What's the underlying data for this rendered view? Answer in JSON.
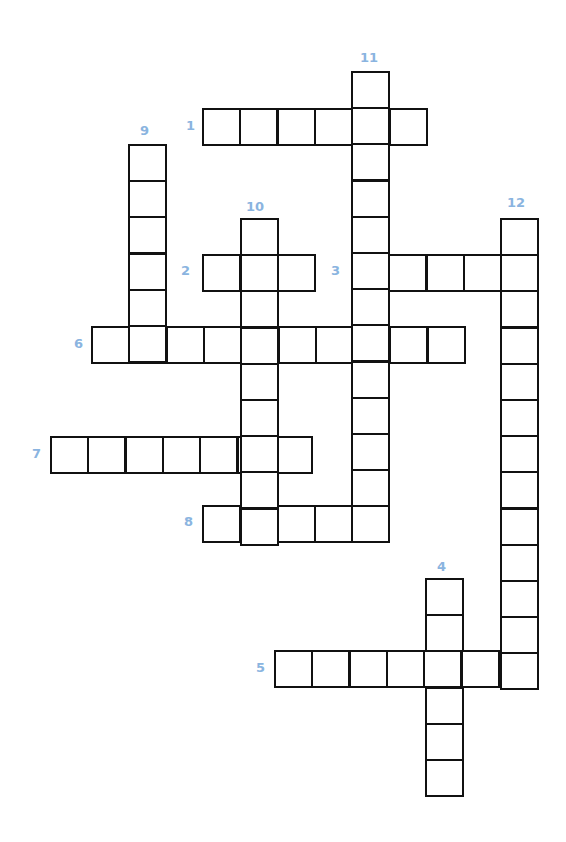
{
  "puzzle": {
    "type": "crossword",
    "label_color": "#8ab4e0",
    "line_color": "#111111",
    "entries": [
      {
        "number": "1",
        "direction": "across",
        "length": 6,
        "x": 202,
        "y": 108,
        "label_x": 186,
        "label_y": 119
      },
      {
        "number": "2",
        "direction": "across",
        "length": 3,
        "x": 202,
        "y": 254,
        "label_x": 181,
        "label_y": 264
      },
      {
        "number": "3",
        "direction": "across",
        "length": 5,
        "x": 351,
        "y": 254,
        "label_x": 331,
        "label_y": 264
      },
      {
        "number": "4",
        "direction": "down",
        "length": 6,
        "x": 425,
        "y": 578,
        "label_x": 437,
        "label_y": 560
      },
      {
        "number": "5",
        "direction": "across",
        "length": 7,
        "x": 274,
        "y": 650,
        "label_x": 256,
        "label_y": 661
      },
      {
        "number": "6",
        "direction": "across",
        "length": 10,
        "x": 91,
        "y": 326,
        "label_x": 74,
        "label_y": 337
      },
      {
        "number": "7",
        "direction": "across",
        "length": 7,
        "x": 50,
        "y": 436,
        "label_x": 32,
        "label_y": 447
      },
      {
        "number": "8",
        "direction": "across",
        "length": 5,
        "x": 202,
        "y": 505,
        "label_x": 184,
        "label_y": 515
      },
      {
        "number": "9",
        "direction": "down",
        "length": 6,
        "x": 128,
        "y": 144,
        "label_x": 140,
        "label_y": 124
      },
      {
        "number": "10",
        "direction": "down",
        "length": 9,
        "x": 240,
        "y": 218,
        "label_x": 246,
        "label_y": 200
      },
      {
        "number": "11",
        "direction": "down",
        "length": 13,
        "x": 351,
        "y": 71,
        "label_x": 360,
        "label_y": 51
      },
      {
        "number": "12",
        "direction": "down",
        "length": 13,
        "x": 500,
        "y": 218,
        "label_x": 507,
        "label_y": 196
      }
    ]
  }
}
